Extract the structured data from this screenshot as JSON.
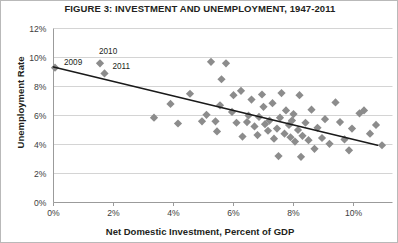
{
  "chart_data": {
    "type": "scatter",
    "title": "FIGURE 3: INVESTMENT AND UNEMPLOYMENT, 1947-2011",
    "xlabel": "Net Domestic Investment, Percent of GDP",
    "ylabel": "Unemployment Rate",
    "xlim": [
      0,
      11.3
    ],
    "ylim": [
      0,
      12
    ],
    "xticks": [
      0,
      2,
      4,
      6,
      8,
      10
    ],
    "xtick_labels": [
      "0%",
      "2%",
      "4%",
      "6%",
      "8%",
      "10%"
    ],
    "yticks": [
      0,
      2,
      4,
      6,
      8,
      10,
      12
    ],
    "ytick_labels": [
      "0%",
      "2%",
      "4%",
      "6%",
      "8%",
      "10%",
      "12%"
    ],
    "grid": "horizontal",
    "legend": "none",
    "marker": "diamond",
    "marker_color": "#8c8c8c",
    "trendline_color": "#1a1a1a",
    "trendline": {
      "x0": 0,
      "y0": 9.35,
      "x1": 10.8,
      "y1": 3.95
    },
    "points": [
      {
        "x": 0.05,
        "y": 9.3,
        "label": "2009"
      },
      {
        "x": 1.55,
        "y": 9.6,
        "label": "2010"
      },
      {
        "x": 1.7,
        "y": 8.9,
        "label": "2011"
      },
      {
        "x": 3.35,
        "y": 5.85
      },
      {
        "x": 3.9,
        "y": 6.8
      },
      {
        "x": 4.15,
        "y": 5.45
      },
      {
        "x": 4.55,
        "y": 7.5
      },
      {
        "x": 4.95,
        "y": 5.6
      },
      {
        "x": 5.1,
        "y": 6.05
      },
      {
        "x": 5.25,
        "y": 9.7
      },
      {
        "x": 5.4,
        "y": 5.6
      },
      {
        "x": 5.45,
        "y": 4.9
      },
      {
        "x": 5.55,
        "y": 6.7
      },
      {
        "x": 5.6,
        "y": 8.5
      },
      {
        "x": 5.75,
        "y": 9.6
      },
      {
        "x": 5.95,
        "y": 6.25
      },
      {
        "x": 6.0,
        "y": 7.4
      },
      {
        "x": 6.1,
        "y": 5.5
      },
      {
        "x": 6.25,
        "y": 7.7
      },
      {
        "x": 6.3,
        "y": 4.55
      },
      {
        "x": 6.45,
        "y": 5.55
      },
      {
        "x": 6.5,
        "y": 6.0
      },
      {
        "x": 6.6,
        "y": 7.1
      },
      {
        "x": 6.7,
        "y": 5.25
      },
      {
        "x": 6.8,
        "y": 4.65
      },
      {
        "x": 6.85,
        "y": 5.9
      },
      {
        "x": 6.95,
        "y": 7.45
      },
      {
        "x": 7.0,
        "y": 6.6
      },
      {
        "x": 7.05,
        "y": 5.4
      },
      {
        "x": 7.15,
        "y": 4.95
      },
      {
        "x": 7.2,
        "y": 5.65
      },
      {
        "x": 7.3,
        "y": 6.85
      },
      {
        "x": 7.35,
        "y": 4.4
      },
      {
        "x": 7.45,
        "y": 5.1
      },
      {
        "x": 7.5,
        "y": 3.2
      },
      {
        "x": 7.55,
        "y": 5.85
      },
      {
        "x": 7.6,
        "y": 7.55
      },
      {
        "x": 7.7,
        "y": 4.75
      },
      {
        "x": 7.75,
        "y": 6.35
      },
      {
        "x": 7.85,
        "y": 5.35
      },
      {
        "x": 7.9,
        "y": 4.5
      },
      {
        "x": 7.95,
        "y": 5.65
      },
      {
        "x": 8.0,
        "y": 6.1
      },
      {
        "x": 8.05,
        "y": 4.2
      },
      {
        "x": 8.15,
        "y": 5.0
      },
      {
        "x": 8.2,
        "y": 7.4
      },
      {
        "x": 8.25,
        "y": 3.15
      },
      {
        "x": 8.3,
        "y": 4.6
      },
      {
        "x": 8.4,
        "y": 5.5
      },
      {
        "x": 8.5,
        "y": 4.3
      },
      {
        "x": 8.6,
        "y": 6.4
      },
      {
        "x": 8.7,
        "y": 3.7
      },
      {
        "x": 8.8,
        "y": 5.15
      },
      {
        "x": 8.95,
        "y": 4.45
      },
      {
        "x": 9.05,
        "y": 5.75
      },
      {
        "x": 9.2,
        "y": 4.05
      },
      {
        "x": 9.4,
        "y": 6.9
      },
      {
        "x": 9.55,
        "y": 5.55
      },
      {
        "x": 9.7,
        "y": 4.35
      },
      {
        "x": 9.85,
        "y": 3.6
      },
      {
        "x": 9.95,
        "y": 5.1
      },
      {
        "x": 10.2,
        "y": 6.15
      },
      {
        "x": 10.35,
        "y": 6.35
      },
      {
        "x": 10.55,
        "y": 4.75
      },
      {
        "x": 10.75,
        "y": 5.35
      },
      {
        "x": 10.95,
        "y": 3.95
      }
    ]
  }
}
